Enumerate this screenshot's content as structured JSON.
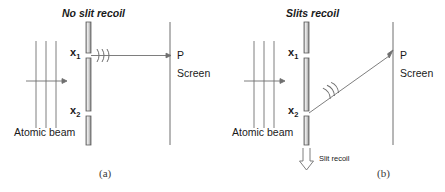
{
  "figure": {
    "width": 445,
    "height": 192,
    "background": "#ffffff",
    "stroke_color": "#555555",
    "bar_fill_light": "#e8e8e8",
    "bar_fill_dark": "#9a9a9a",
    "text_color": "#1a1a1a"
  },
  "panels": [
    {
      "id": "a",
      "title": "No slit recoil",
      "caption": "(a)",
      "beam_label": "Atomic beam",
      "slit_top_label": "x",
      "slit_top_sub": "1",
      "slit_bottom_label": "x",
      "slit_bottom_sub": "2",
      "point_label": "P",
      "screen_label": "Screen",
      "wave_marks": 3,
      "ray": "horizontal",
      "recoil_arrow": null,
      "recoil_arrow_label": null
    },
    {
      "id": "b",
      "title": "Slits recoil",
      "caption": "(b)",
      "beam_label": "Atomic beam",
      "slit_top_label": "x",
      "slit_top_sub": "1",
      "slit_bottom_label": "x",
      "slit_bottom_sub": "2",
      "point_label": "P",
      "screen_label": "Screen",
      "wave_marks": 3,
      "ray": "diagonal",
      "recoil_arrow": "down",
      "recoil_arrow_label": "Slit recoil"
    }
  ]
}
